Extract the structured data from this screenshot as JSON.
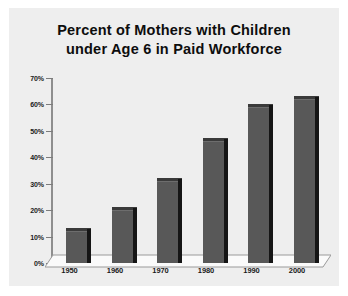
{
  "chart_data": {
    "type": "bar",
    "title": "Percent of Mothers with Children under Age 6 in Paid Workforce",
    "title_lines": [
      "Percent of Mothers with Children",
      "under Age 6 in Paid Workforce"
    ],
    "xlabel": "",
    "ylabel": "",
    "categories": [
      "1950",
      "1960",
      "1970",
      "1980",
      "1990",
      "2000"
    ],
    "values": [
      12,
      20,
      31,
      46,
      59,
      62
    ],
    "ylim": [
      0,
      70
    ],
    "ytick_values": [
      0,
      10,
      20,
      30,
      40,
      50,
      60,
      70
    ],
    "ytick_labels": [
      "0%",
      "10%",
      "20%",
      "30%",
      "40%",
      "50%",
      "60%",
      "70%"
    ],
    "grid": false,
    "legend": null,
    "series": [
      {
        "name": "Percent in paid workforce",
        "values": [
          12,
          20,
          31,
          46,
          59,
          62
        ]
      }
    ],
    "colors": {
      "bar_face": "#585858",
      "bar_side": "#151515",
      "bar_top": "#3a3a3a",
      "panel_background": "#eeeeee",
      "axis_line": "#8e8e8e",
      "text": "#1a1a1a",
      "floor": "#f7f7f7"
    },
    "style": "3d-column"
  }
}
